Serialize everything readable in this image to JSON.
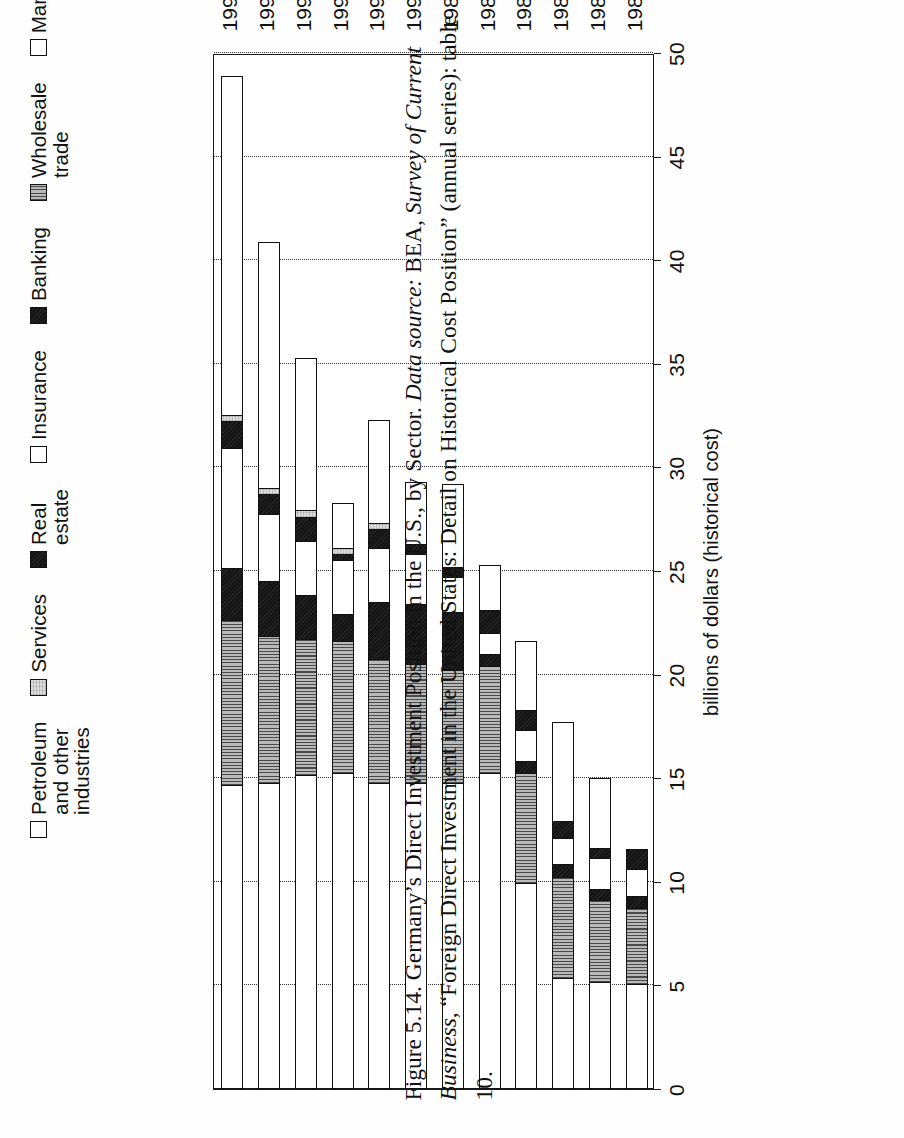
{
  "figure": {
    "number": "Figure 5.14.",
    "caption_main": "Germany’s Direct Investment Position in the U.S., by Sector.",
    "caption_source_label": "Data source:",
    "caption_source_rest": " BEA, ",
    "caption_source_italic1": "Survey of Current Business",
    "caption_source_rest2": ", “Foreign Direct Investment in the United States: Detail on Historical Cost Position” (annual series): table 10.",
    "orientation": "rotated-90-ccw"
  },
  "axis": {
    "value_title": "billions of dollars (historical cost)",
    "value_ticks": [
      "50",
      "45",
      "40",
      "35",
      "30",
      "25",
      "20",
      "15",
      "10",
      "5",
      "0"
    ],
    "value_min": 0,
    "value_max": 50,
    "category_ticks": [
      "1984",
      "1985",
      "1986",
      "1987",
      "1988",
      "1989",
      "1990",
      "1991",
      "1992",
      "1993",
      "1994",
      "1995"
    ]
  },
  "legend": {
    "items": [
      {
        "label": "Petroleum and other industries",
        "swatch": "white-square-icon",
        "fill": "f-white"
      },
      {
        "label": "Services",
        "swatch": "light-gray-square-icon",
        "fill": "f-ltgray"
      },
      {
        "label": "Real estate",
        "swatch": "black-square-icon",
        "fill": "f-black"
      },
      {
        "label": "Insurance",
        "swatch": "white-square-icon",
        "fill": "f-white"
      },
      {
        "label": "Banking",
        "swatch": "black-square-icon",
        "fill": "f-black"
      },
      {
        "label": "Wholesale trade",
        "swatch": "vertical-lines-square-icon",
        "fill": "f-vlines"
      },
      {
        "label": "Manufacturing",
        "swatch": "white-square-icon",
        "fill": "f-white"
      }
    ]
  },
  "chart_data": {
    "type": "bar",
    "orientation": "horizontal-stacked",
    "title": "Germany’s Direct Investment Position in the U.S., by Sector",
    "xlabel": "billions of dollars (historical cost)",
    "ylabel": "",
    "xlim": [
      0,
      50
    ],
    "grid": "dotted vertical gridlines at every 5 units",
    "legend_position": "above plot, right of center",
    "categories": [
      "1984",
      "1985",
      "1986",
      "1987",
      "1988",
      "1989",
      "1990",
      "1991",
      "1992",
      "1993",
      "1994",
      "1995"
    ],
    "series": [
      {
        "name": "Manufacturing",
        "fill": "f-white",
        "values": [
          5.0,
          5.1,
          5.3,
          9.9,
          15.2,
          14.7,
          14.7,
          14.7,
          15.2,
          15.1,
          14.7,
          14.6
        ]
      },
      {
        "name": "Wholesale trade",
        "fill": "f-vlines",
        "values": [
          3.7,
          4.0,
          4.9,
          5.3,
          5.2,
          5.5,
          5.8,
          6.0,
          6.4,
          6.6,
          7.1,
          8.0
        ]
      },
      {
        "name": "Banking",
        "fill": "f-black",
        "values": [
          0.6,
          0.5,
          0.6,
          0.6,
          0.6,
          2.8,
          2.9,
          2.8,
          1.3,
          2.1,
          2.7,
          2.5
        ]
      },
      {
        "name": "Insurance",
        "fill": "f-white",
        "values": [
          1.3,
          1.5,
          1.3,
          1.5,
          1.0,
          1.7,
          2.4,
          2.6,
          2.6,
          2.6,
          3.2,
          5.8
        ]
      },
      {
        "name": "Real estate",
        "fill": "f-black",
        "values": [
          1.0,
          0.5,
          0.8,
          1.0,
          1.1,
          0.5,
          0.5,
          0.9,
          0.3,
          1.2,
          1.0,
          1.3
        ]
      },
      {
        "name": "Services",
        "fill": "f-ltgray",
        "values": [
          0.0,
          0.0,
          0.0,
          0.0,
          0.0,
          0.0,
          0.0,
          0.3,
          0.3,
          0.3,
          0.3,
          0.3
        ]
      },
      {
        "name": "Petroleum and other industries",
        "fill": "f-white",
        "values": [
          0.0,
          3.4,
          4.8,
          3.3,
          2.2,
          4.0,
          3.0,
          5.0,
          2.2,
          7.4,
          11.9,
          16.4
        ]
      }
    ],
    "totals": [
      11.6,
      15.0,
      17.7,
      21.6,
      25.3,
      29.2,
      29.3,
      32.3,
      28.3,
      35.3,
      40.9,
      48.9
    ]
  }
}
